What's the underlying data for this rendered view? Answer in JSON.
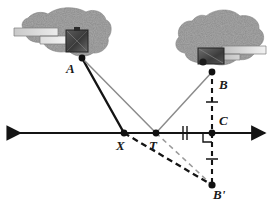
{
  "figure": {
    "type": "geometry-diagram",
    "background_color": "#ffffff",
    "line_color_solid_dark": "#141414",
    "line_color_solid_gray": "#8c8c8c",
    "line_color_dashed_dark": "#141414",
    "line_color_dashed_gray": "#9a9a9a",
    "land_fill_color": "#a8a8a8",
    "building_color": "#3d3d3d"
  },
  "points": [
    {
      "id": "A",
      "label": "A",
      "x": 82,
      "y": 58,
      "label_x": 66,
      "label_y": 62
    },
    {
      "id": "B",
      "label": "B",
      "x": 212,
      "y": 72,
      "label_x": 219,
      "label_y": 78
    },
    {
      "id": "C",
      "label": "C",
      "x": 212,
      "y": 133,
      "label_x": 219,
      "label_y": 118
    },
    {
      "id": "X",
      "label": "X",
      "x": 124,
      "y": 133,
      "label_x": 118,
      "label_y": 140
    },
    {
      "id": "T",
      "label": "T",
      "x": 156,
      "y": 133,
      "label_x": 150,
      "label_y": 140
    },
    {
      "id": "Bp",
      "label": "B'",
      "x": 212,
      "y": 185,
      "label_x": 214,
      "label_y": 188
    }
  ],
  "baseline": {
    "name": "horizontal-line",
    "x1": 8,
    "x2": 265,
    "y": 133,
    "arrow_left": true,
    "arrow_right": true
  },
  "segments": [
    {
      "name": "segment-A-to-X",
      "from": "A",
      "to": "X",
      "style": "solid",
      "weight": "thick",
      "color": "#141414"
    },
    {
      "name": "segment-A-to-T",
      "from": "A",
      "to": "T",
      "style": "solid",
      "weight": "thin",
      "color": "#8c8c8c"
    },
    {
      "name": "segment-T-to-B",
      "from": "T",
      "to": "B",
      "style": "solid",
      "weight": "thin",
      "color": "#8c8c8c"
    },
    {
      "name": "segment-X-to-Bprime",
      "from": "X",
      "to": "Bp",
      "style": "dashed",
      "weight": "thick",
      "color": "#141414"
    },
    {
      "name": "segment-T-to-Bprime",
      "from": "T",
      "to": "Bp",
      "style": "dashed",
      "weight": "thin",
      "color": "#9a9a9a"
    },
    {
      "name": "segment-B-to-Bprime-through-C",
      "from": "B",
      "to": "Bp",
      "style": "dashed",
      "weight": "thick",
      "color": "#141414"
    }
  ],
  "marks": [
    {
      "name": "congruence-tick-TC",
      "kind": "double-tick",
      "x": 185,
      "y": 133,
      "orientation": "vertical"
    },
    {
      "name": "congruence-tick-BC",
      "kind": "single-tick",
      "x": 212,
      "y": 102,
      "orientation": "horizontal"
    },
    {
      "name": "congruence-tick-CBprime",
      "kind": "single-tick",
      "x": 212,
      "y": 159,
      "orientation": "horizontal"
    },
    {
      "name": "right-angle-mark-at-C",
      "kind": "right-angle",
      "x": 212,
      "y": 133
    }
  ],
  "landmasses": [
    {
      "name": "landmass-left",
      "label_point": "A",
      "building": {
        "name": "building-left",
        "x": 66,
        "y": 30,
        "w": 22,
        "h": 22
      }
    },
    {
      "name": "landmass-right",
      "label_point": "B",
      "building": {
        "name": "building-right",
        "x": 198,
        "y": 48,
        "w": 26,
        "h": 16
      }
    }
  ]
}
